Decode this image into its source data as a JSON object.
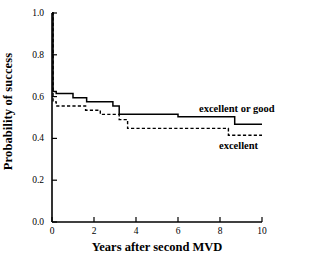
{
  "chart_data": {
    "type": "line",
    "subtype": "kaplan-meier-step",
    "title": "",
    "xlabel": "Years after second MVD",
    "ylabel": "Probability of success",
    "xlim": [
      0,
      10
    ],
    "ylim": [
      0.0,
      1.0
    ],
    "xticks": [
      0,
      2,
      4,
      6,
      8,
      10
    ],
    "xtick_labels": [
      "0",
      "2",
      "4",
      "6",
      "8",
      "10"
    ],
    "yticks": [
      0.0,
      0.2,
      0.4,
      0.6,
      0.8,
      1.0
    ],
    "ytick_labels": [
      "0.0",
      "0.2",
      "0.4",
      "0.6",
      "0.8",
      "1.0"
    ],
    "grid": false,
    "legend_position": "inline-right",
    "series": [
      {
        "name": "excellent or good",
        "style": "solid",
        "color": "#000000",
        "label_x": 8.2,
        "label_y": 0.545,
        "x": [
          0.0,
          0.05,
          0.05,
          0.2,
          0.2,
          1.0,
          1.0,
          1.65,
          1.65,
          2.9,
          2.9,
          3.2,
          3.2,
          6.0,
          6.0,
          8.7,
          8.7,
          10.0
        ],
        "y": [
          1.0,
          1.0,
          0.625,
          0.625,
          0.615,
          0.615,
          0.595,
          0.595,
          0.575,
          0.575,
          0.555,
          0.555,
          0.515,
          0.515,
          0.503,
          0.503,
          0.468,
          0.468
        ]
      },
      {
        "name": "excellent",
        "style": "dashed",
        "color": "#000000",
        "label_x": 8.4,
        "label_y": 0.355,
        "x": [
          0.0,
          0.05,
          0.05,
          0.2,
          0.2,
          1.6,
          1.6,
          2.3,
          2.3,
          3.2,
          3.2,
          3.6,
          3.6,
          8.4,
          8.4,
          10.0
        ],
        "y": [
          1.0,
          1.0,
          0.575,
          0.575,
          0.555,
          0.555,
          0.535,
          0.535,
          0.515,
          0.515,
          0.49,
          0.49,
          0.448,
          0.448,
          0.415,
          0.415
        ]
      }
    ],
    "annotations": [
      {
        "text": "excellent or good",
        "x": 8.2,
        "y": 0.545
      },
      {
        "text": "excellent",
        "x": 8.4,
        "y": 0.355
      }
    ]
  },
  "axes": {
    "x_title": "Years after second MVD",
    "y_title": "Probability of success",
    "x_tick_labels": [
      "0",
      "2",
      "4",
      "6",
      "8",
      "10"
    ],
    "y_tick_labels": [
      "0.0",
      "0.2",
      "0.4",
      "0.6",
      "0.8",
      "1.0"
    ]
  },
  "labels": {
    "series_one": "excellent or good",
    "series_two": "excellent"
  },
  "colors": {
    "axis": "#000000",
    "line": "#000000",
    "background": "#ffffff"
  }
}
